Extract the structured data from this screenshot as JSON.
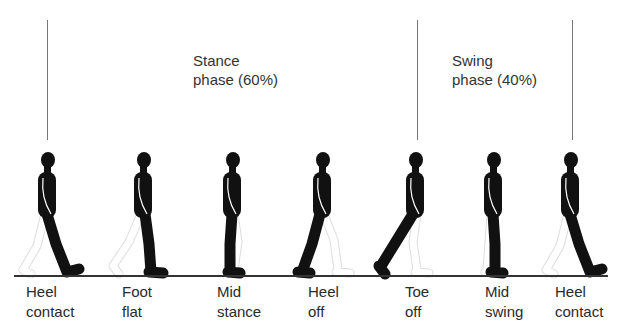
{
  "phases": [
    {
      "line1": "Stance",
      "line2": "phase (60%)",
      "percent": 60
    },
    {
      "line1": "Swing",
      "line2": "phase (40%)",
      "percent": 40
    }
  ],
  "events": [
    {
      "line1": "Heel",
      "line2": "contact",
      "pose": "heel-contact"
    },
    {
      "line1": "Foot",
      "line2": "flat",
      "pose": "foot-flat"
    },
    {
      "line1": "Mid",
      "line2": "stance",
      "pose": "mid-stance"
    },
    {
      "line1": "Heel",
      "line2": "off",
      "pose": "heel-off"
    },
    {
      "line1": "Toe",
      "line2": "off",
      "pose": "toe-off"
    },
    {
      "line1": "Mid",
      "line2": "swing",
      "pose": "mid-swing"
    },
    {
      "line1": "Heel",
      "line2": "contact",
      "pose": "heel-contact"
    }
  ],
  "colors": {
    "body": "#111111",
    "outline": "#ffffff",
    "line": "#777777"
  }
}
